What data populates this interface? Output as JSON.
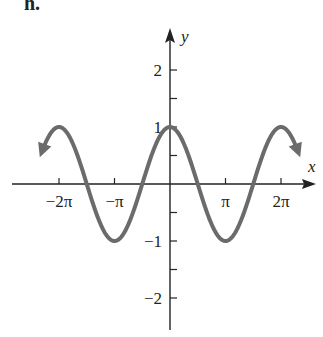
{
  "panel_label": "h.",
  "chart_data": {
    "type": "line",
    "title": "",
    "function": "y = cos(x)",
    "xlabel": "x",
    "ylabel": "y",
    "x_ticks": [
      "−2π",
      "−π",
      "π",
      "2π"
    ],
    "x_tick_values": [
      -6.2832,
      -3.1416,
      3.1416,
      6.2832
    ],
    "y_ticks": [
      "2",
      "1",
      "−1",
      "−2"
    ],
    "y_tick_values": [
      2,
      1,
      -1,
      -2
    ],
    "xlim": [
      -8.5,
      8.5
    ],
    "ylim": [
      -2.6,
      2.6
    ],
    "grid": false,
    "legend": "none",
    "curve_color": "#6b6b6b",
    "series": [
      {
        "name": "cos(x)",
        "x": [
          -7.5,
          -6.2832,
          -4.7124,
          -3.1416,
          -1.5708,
          0,
          1.5708,
          3.1416,
          4.7124,
          6.2832,
          7.5
        ],
        "values": [
          0.35,
          1,
          0,
          -1,
          0,
          1,
          0,
          -1,
          0,
          1,
          0.35
        ]
      }
    ]
  }
}
